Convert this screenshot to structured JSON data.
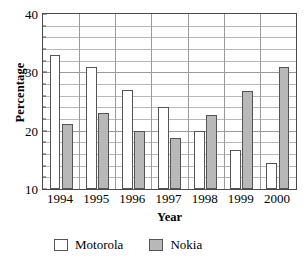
{
  "chart_data": {
    "type": "bar",
    "title": "",
    "subtitle": "",
    "xlabel": "Year",
    "ylabel": "Percentage",
    "categories": [
      "1994",
      "1995",
      "1996",
      "1997",
      "1998",
      "1999",
      "2000"
    ],
    "series": [
      {
        "name": "Motorola",
        "color": "#ffffff",
        "values": [
          33,
          31,
          27,
          24,
          20,
          16.7,
          14.5
        ]
      },
      {
        "name": "Nokia",
        "color": "#b8b8b8",
        "values": [
          21.2,
          23,
          20,
          18.7,
          22.7,
          26.8,
          31
        ]
      }
    ],
    "ylim": [
      10,
      40
    ],
    "y_ticks": [
      10,
      20,
      30,
      40
    ],
    "y_tick_labels": [
      "10",
      "20",
      "30",
      "40"
    ],
    "y_minor_tick_step": 2,
    "grid": true,
    "grid_horizontal": true,
    "grid_vertical": true,
    "legend_position": "bottom-left"
  },
  "legend": {
    "entries": [
      {
        "label": "Motorola",
        "swatch": "white-square-swatch"
      },
      {
        "label": "Nokia",
        "swatch": "gray-square-swatch"
      }
    ]
  }
}
